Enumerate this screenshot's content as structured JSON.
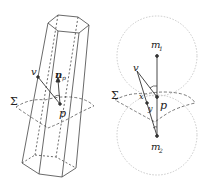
{
  "figure": {
    "left_panel": {
      "description": "hexagonal prism crossed by surface",
      "labels": {
        "v": "v",
        "n": "n",
        "n_sub": "p",
        "p": "p",
        "sigma": "Σ"
      }
    },
    "right_panel": {
      "description": "two tangent circles with centers m1, m2 and surface through p",
      "labels": {
        "m1": "m",
        "m1_sub": "1",
        "m2": "m",
        "m2_sub": "2",
        "v": "v",
        "x": "x",
        "y": "y",
        "p": "p",
        "sigma": "Σ"
      }
    },
    "colors": {
      "line": "#333333",
      "circle": "#bdbdbd",
      "surface": "#555555"
    }
  }
}
